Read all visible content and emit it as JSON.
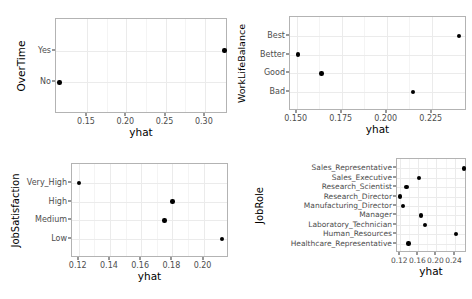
{
  "chart_data": [
    {
      "type": "scatter",
      "panel": "overtime",
      "ylabel": "OverTime",
      "xlabel": "yhat",
      "categories": [
        "No",
        "Yes"
      ],
      "values": [
        0.115,
        0.325
      ],
      "xticks": [
        "0.15",
        "0.20",
        "0.25",
        "0.30"
      ],
      "xtickvals": [
        0.15,
        0.2,
        0.25,
        0.3
      ],
      "xlim": [
        0.1105,
        0.3295
      ],
      "grid": true
    },
    {
      "type": "scatter",
      "panel": "worklifebalance",
      "ylabel": "WorkLifeBalance",
      "xlabel": "yhat",
      "categories": [
        "Bad",
        "Good",
        "Better",
        "Best"
      ],
      "values": [
        0.2145,
        0.1637,
        0.1508,
        0.2401
      ],
      "xticks": [
        "0.150",
        "0.175",
        "0.200",
        "0.225"
      ],
      "xtickvals": [
        0.15,
        0.175,
        0.2,
        0.225
      ],
      "xlim": [
        0.1463,
        0.2446
      ],
      "grid": true
    },
    {
      "type": "scatter",
      "panel": "jobsatisfaction",
      "ylabel": "JobSatisfaction",
      "xlabel": "yhat",
      "categories": [
        "Low",
        "Medium",
        "High",
        "Very_High"
      ],
      "values": [
        0.2118,
        0.1749,
        0.18,
        0.1202
      ],
      "xticks": [
        "0.12",
        "0.14",
        "0.16",
        "0.18",
        "0.20"
      ],
      "xtickvals": [
        0.12,
        0.14,
        0.16,
        0.18,
        0.2
      ],
      "xlim": [
        0.1157,
        0.2163
      ],
      "grid": true
    },
    {
      "type": "scatter",
      "panel": "jobrole",
      "ylabel": "JobRole",
      "xlabel": "yhat",
      "categories": [
        "Healthcare_Representative",
        "Human_Resources",
        "Laboratory_Technician",
        "Manager",
        "Manufacturing_Director",
        "Research_Director",
        "Research_Scientist",
        "Sales_Executive",
        "Sales_Representative"
      ],
      "values": [
        0.1383,
        0.2429,
        0.174,
        0.1662,
        0.1262,
        0.1198,
        0.1337,
        0.162,
        0.2605
      ],
      "xticks": [
        "0.12",
        "0.16",
        "0.20",
        "0.24"
      ],
      "xtickvals": [
        0.12,
        0.16,
        0.2,
        0.24
      ],
      "xlim": [
        0.1128,
        0.2675
      ],
      "grid": true
    }
  ],
  "colors": {
    "point": "#000000",
    "grid": "#ebebeb",
    "panel_border": "#b3b3b3",
    "tick_text": "#4d4d4d",
    "title_text": "#000000",
    "background": "#ffffff"
  }
}
